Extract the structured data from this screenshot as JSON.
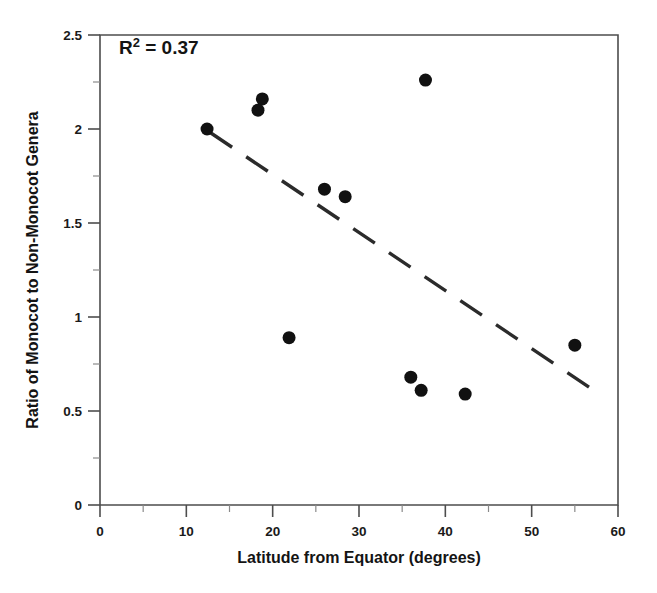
{
  "chart_data": {
    "type": "scatter",
    "title": "",
    "xlabel": "Latitude from Equator (degrees)",
    "ylabel": "Ratio of Monocot to Non-Monocot Genera",
    "xlim": [
      0,
      60
    ],
    "ylim": [
      0,
      2.5
    ],
    "xticks": [
      0,
      10,
      20,
      30,
      40,
      50,
      60
    ],
    "xtick_labels": [
      "0",
      "10",
      "20",
      "30",
      "40",
      "50",
      "60"
    ],
    "xminor_ticks": [
      5,
      15,
      25,
      35,
      45,
      55
    ],
    "yticks": [
      0,
      0.5,
      1,
      1.5,
      2,
      2.5
    ],
    "ytick_labels": [
      "0",
      "0.5",
      "1",
      "1.5",
      "2",
      "2.5"
    ],
    "yminor_ticks": [
      0.25,
      0.75,
      1.25,
      1.75,
      2.25
    ],
    "grid": false,
    "legend": null,
    "annotations": [
      {
        "name": "r-squared",
        "text_prefix": "R",
        "text_sup": "2",
        "text_suffix": " = 0.37",
        "full_text": "R2 = 0.37",
        "value": 0.37,
        "x": 2.2,
        "y": 2.4
      }
    ],
    "points": [
      {
        "x": 12.4,
        "y": 2.0
      },
      {
        "x": 18.8,
        "y": 2.16
      },
      {
        "x": 18.3,
        "y": 2.1
      },
      {
        "x": 21.9,
        "y": 0.89
      },
      {
        "x": 26.0,
        "y": 1.68
      },
      {
        "x": 28.4,
        "y": 1.64
      },
      {
        "x": 36.0,
        "y": 0.68
      },
      {
        "x": 37.2,
        "y": 0.61
      },
      {
        "x": 37.7,
        "y": 2.26
      },
      {
        "x": 42.3,
        "y": 0.59
      },
      {
        "x": 55.0,
        "y": 0.85
      }
    ],
    "trend_line": {
      "style": "dashed",
      "x_start": 12.8,
      "y_start": 1.98,
      "x_end": 58.0,
      "y_end": 0.585
    },
    "marker": {
      "shape": "circle",
      "color": "#111111",
      "size_px": 9
    }
  }
}
